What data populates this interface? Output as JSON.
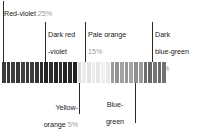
{
  "chart_data": {
    "type": "bar",
    "title": "",
    "xlabel": "",
    "ylabel": "",
    "orientation": "horizontal-stacked",
    "grid": false,
    "legend": "callouts",
    "categories": [
      "Red-violet",
      "Dark red-violet",
      "Yellow-orange",
      "Pale orange",
      "Blue-green",
      "Dark blue-green"
    ],
    "values": [
      25,
      20,
      5,
      15,
      20,
      15
    ],
    "unit": "%",
    "segments": [
      {
        "name": "Red-violet",
        "value": 25,
        "label": "25%",
        "color": "#3a3a3a"
      },
      {
        "name": "Dark red-violet",
        "value": 20,
        "label": "20%",
        "color": "#272727"
      },
      {
        "name": "Yellow-orange",
        "value": 5,
        "label": "5%",
        "color": "#d8d8d8"
      },
      {
        "name": "Pale orange",
        "value": 15,
        "label": "15%",
        "color": "#e9e9e9"
      },
      {
        "name": "Blue-green",
        "value": 20,
        "label": "20%",
        "color": "#9a9a9a"
      },
      {
        "name": "Dark blue-green",
        "value": 15,
        "label": "15%",
        "color": "#6e6e6e"
      }
    ],
    "stripes": [
      "#3c3c3c",
      "#343434",
      "#3e3e3e",
      "#363636",
      "#414141",
      "#383838",
      "#3d3d3d",
      "#333333",
      "#2a2a2a",
      "#232323",
      "#2d2d2d",
      "#252525",
      "#2e2e2e",
      "#222222",
      "#292929",
      "#202020",
      "#d9d9d9",
      "#ececec",
      "#e4e4e4",
      "#efefef",
      "#e7e7e7",
      "#f1f1f1",
      "#e9e9e9",
      "#9d9d9d",
      "#939393",
      "#a2a2a2",
      "#979797",
      "#a5a5a5",
      "#8f8f8f",
      "#9b9b9b",
      "#6f6f6f",
      "#676767",
      "#757575",
      "#6b6b6b",
      "#717171"
    ]
  },
  "callouts": {
    "red_violet": {
      "name": "Red-violet",
      "pct": "25%"
    },
    "dark_red_violet": {
      "name_line1": "Dark red",
      "name_line2": "-violet",
      "pct": "20%"
    },
    "pale_orange": {
      "name": "Pale orange",
      "pct": "15%"
    },
    "dark_blue_green": {
      "name_line1": "Dark",
      "name_line2": "blue-green",
      "pct": "15%"
    },
    "yellow_orange": {
      "name_line1": "Yellow-",
      "name_line2": "orange",
      "pct": "5%"
    },
    "blue_green": {
      "name_line1": "Blue-",
      "name_line2": "green",
      "pct": "20%"
    }
  },
  "colors": {
    "text": "#1b1b1b",
    "pct_text": "#9a9a9a",
    "leader_line": "#2b2b2b",
    "background": "#ffffff"
  }
}
